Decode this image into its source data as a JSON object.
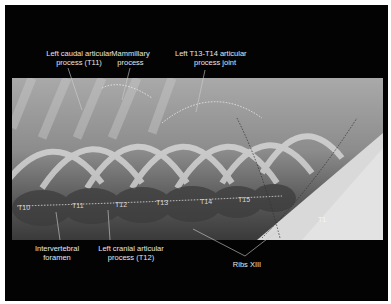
{
  "figure": {
    "type": "annotated lateral radiograph of thoracic spine",
    "background_color": "#030303",
    "label_color": "#e6e6e6",
    "top_labels": [
      {
        "id": "left-caudal-articular-process",
        "line1": "Left caudal articular",
        "line2": "process (T11)"
      },
      {
        "id": "mammillary-process",
        "line1": "Mammillary",
        "line2": "process"
      },
      {
        "id": "left-t13-t14-articular-process-joint",
        "line1": "Left T13-T14 articular",
        "line2": "process joint"
      }
    ],
    "bottom_labels": [
      {
        "id": "intervertebral-foramen",
        "line1": "Intervertebral",
        "line2": "foramen"
      },
      {
        "id": "left-cranial-articular-process",
        "line1": "Left cranial articular",
        "line2": "process (T12)"
      },
      {
        "id": "ribs-xiii",
        "line1": "Ribs XIII",
        "line2": ""
      }
    ],
    "vertebra_labels": [
      "T10",
      "T11",
      "T12",
      "T13",
      "T14",
      "T15",
      "T1"
    ]
  }
}
